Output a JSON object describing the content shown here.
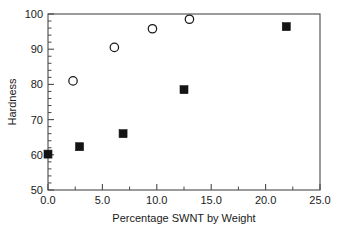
{
  "chart_data": {
    "type": "scatter",
    "title": "",
    "xlabel": "Percentage SWNT by Weight",
    "ylabel": "Hardness",
    "xlim": [
      0.0,
      25.0
    ],
    "ylim": [
      50,
      100
    ],
    "xticks": [
      "0.0",
      "5.0",
      "10.0",
      "15.0",
      "20.0",
      "25.0"
    ],
    "xtick_values": [
      0.0,
      5.0,
      10.0,
      15.0,
      20.0,
      25.0
    ],
    "x_minor_step": 2.5,
    "yticks": [
      "50",
      "60",
      "70",
      "80",
      "90",
      "100"
    ],
    "ytick_values": [
      50,
      60,
      70,
      80,
      90,
      100
    ],
    "y_minor_step": 2,
    "grid": false,
    "legend": null,
    "series": [
      {
        "name": "open-circles",
        "marker": "open-circle",
        "color": "#1a1a1a",
        "points": [
          {
            "x": 2.3,
            "y": 81.0
          },
          {
            "x": 6.1,
            "y": 90.5
          },
          {
            "x": 9.6,
            "y": 95.8
          },
          {
            "x": 13.0,
            "y": 98.5
          }
        ]
      },
      {
        "name": "filled-squares",
        "marker": "filled-square",
        "color": "#141414",
        "points": [
          {
            "x": 0.0,
            "y": 60.2
          },
          {
            "x": 2.9,
            "y": 62.3
          },
          {
            "x": 6.9,
            "y": 66.0
          },
          {
            "x": 12.5,
            "y": 78.5
          },
          {
            "x": 21.9,
            "y": 96.4
          }
        ]
      }
    ]
  },
  "geometry": {
    "plot_left": 48,
    "plot_right": 320,
    "plot_top": 14,
    "plot_bottom": 190
  }
}
